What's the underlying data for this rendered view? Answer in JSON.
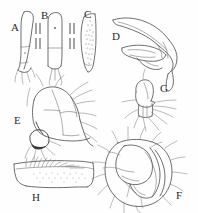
{
  "figure": {
    "kind": "scientific-line-drawing-plate",
    "panel_count": 8,
    "ink_color": "#4a4a4a",
    "background_color": "#ffffff",
    "label_color": "#2b2b2b"
  },
  "panels": [
    {
      "id": "A",
      "label": "A",
      "label_x": 11,
      "label_y": 22,
      "subject": "elongate-slender-appendage-lateral"
    },
    {
      "id": "B",
      "label": "B",
      "label_x": 41,
      "label_y": 10,
      "subject": "elongate-appendage-with-apical-fork"
    },
    {
      "id": "C",
      "label": "C",
      "label_x": 84,
      "label_y": 9,
      "subject": "curved-blade-with-stippled-field"
    },
    {
      "id": "D",
      "label": "D",
      "label_x": 112,
      "label_y": 31,
      "subject": "hooked-sclerite-complex-lateral"
    },
    {
      "id": "E",
      "label": "E",
      "label_x": 14,
      "label_y": 115,
      "subject": "setose-body-segment-with-dark-process"
    },
    {
      "id": "F",
      "label": "F",
      "label_x": 176,
      "label_y": 190,
      "subject": "rounded-setose-terminal-capsule"
    },
    {
      "id": "G",
      "label": "G",
      "label_x": 160,
      "label_y": 83,
      "subject": "small-setose-lobe-with-bristle-tuft"
    },
    {
      "id": "H",
      "label": "H",
      "label_x": 32,
      "label_y": 192,
      "subject": "elongate-transverse-segment-with-setal-row"
    }
  ],
  "scale_bars": [
    {
      "for_panel": "A-B",
      "orientation": "vertical",
      "x": 36,
      "y_top": 22,
      "y_bottom": 58
    },
    {
      "for_panel": "B-C",
      "orientation": "vertical",
      "x": 71,
      "y_top": 22,
      "y_bottom": 58
    }
  ]
}
